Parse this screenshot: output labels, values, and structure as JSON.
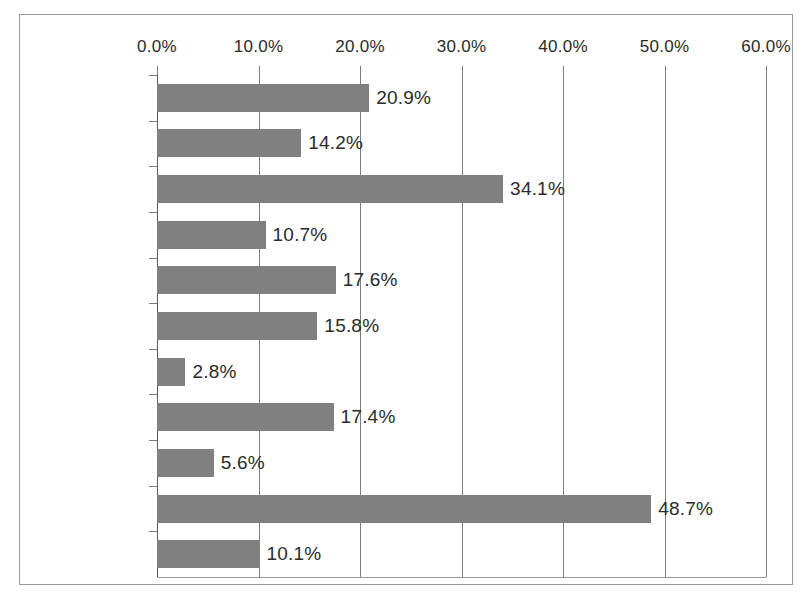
{
  "chart_data": {
    "type": "bar",
    "orientation": "horizontal",
    "title": "",
    "xlabel": "",
    "ylabel": "",
    "xlim": [
      0,
      60
    ],
    "xtick_labels": [
      "0.0%",
      "10.0%",
      "20.0%",
      "30.0%",
      "40.0%",
      "50.0%",
      "60.0%"
    ],
    "xticks": [
      0,
      10,
      20,
      30,
      40,
      50,
      60
    ],
    "grid": true,
    "legend": false,
    "bar_color": "#808080",
    "categories": [
      "避難誘導",
      "救出救助",
      "安否確認",
      "捜索",
      "物資調達",
      "物資配給",
      "地域防犯",
      "避難所運営",
      "道路整備",
      "はげまし",
      "その他"
    ],
    "values": [
      20.9,
      14.2,
      34.1,
      10.7,
      17.6,
      15.8,
      2.8,
      17.4,
      5.6,
      48.7,
      10.1
    ],
    "value_labels": [
      "20.9%",
      "14.2%",
      "34.1%",
      "10.7%",
      "17.6%",
      "15.8%",
      "2.8%",
      "17.4%",
      "5.6%",
      "48.7%",
      "10.1%"
    ]
  }
}
